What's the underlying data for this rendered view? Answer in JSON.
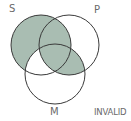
{
  "diagram": {
    "type": "venn-3",
    "labels": {
      "S": "S",
      "P": "P",
      "M": "M"
    },
    "verdict": "INVALID",
    "colors": {
      "shade": "#a9bdb2",
      "stroke": "#3a3a3a",
      "label": "#6a6a6a"
    },
    "circles": {
      "S": {
        "cx": 41,
        "cy": 45,
        "r": 30
      },
      "P": {
        "cx": 69,
        "cy": 45,
        "r": 30
      },
      "M": {
        "cx": 55,
        "cy": 74,
        "r": 30
      }
    },
    "shaded_regions": [
      "S only",
      "S∩P (not M)",
      "S∩P∩M",
      "P∩M (not S)"
    ],
    "unshaded_regions": [
      "S∩M (not P)",
      "P only",
      "M only"
    ]
  }
}
